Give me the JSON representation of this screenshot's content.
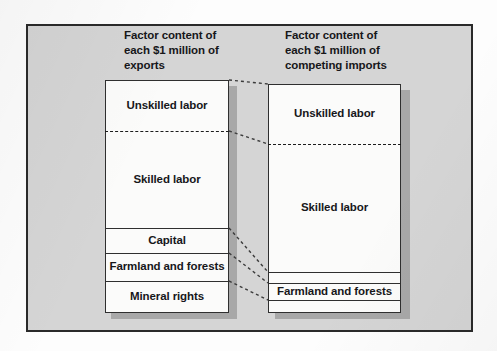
{
  "figure": {
    "columns": [
      {
        "id": "exports",
        "title": "Factor content of\neach $1 million of\nexports",
        "segments": [
          {
            "label": "Unskilled labor",
            "top": 80,
            "bottom": 131,
            "divider": "dashed"
          },
          {
            "label": "Skilled labor",
            "top": 131,
            "bottom": 228,
            "divider": "solid"
          },
          {
            "label": "Capital",
            "top": 228,
            "bottom": 253,
            "divider": "solid"
          },
          {
            "label": "Farmland and forests",
            "top": 253,
            "bottom": 281,
            "divider": "solid"
          },
          {
            "label": "Mineral rights",
            "top": 281,
            "bottom": 313,
            "divider": "none"
          }
        ]
      },
      {
        "id": "competing-imports",
        "title": "Factor content of\neach $1 million of\ncompeting imports",
        "segments": [
          {
            "label": "Unskilled labor",
            "top": 84,
            "bottom": 144,
            "divider": "dashed"
          },
          {
            "label": "Skilled labor",
            "top": 144,
            "bottom": 272,
            "divider": "solid"
          },
          {
            "label": "",
            "top": 272,
            "bottom": 283,
            "divider": "solid"
          },
          {
            "label": "Farmland and forests",
            "top": 283,
            "bottom": 300,
            "divider": "solid"
          },
          {
            "label": "",
            "top": 300,
            "bottom": 313,
            "divider": "none"
          }
        ]
      }
    ],
    "connectors": [
      {
        "x1": 229,
        "y1": 80,
        "x2": 268,
        "y2": 84
      },
      {
        "x1": 229,
        "y1": 131,
        "x2": 268,
        "y2": 144
      },
      {
        "x1": 229,
        "y1": 228,
        "x2": 268,
        "y2": 272
      },
      {
        "x1": 229,
        "y1": 253,
        "x2": 268,
        "y2": 283
      },
      {
        "x1": 229,
        "y1": 281,
        "x2": 268,
        "y2": 300
      }
    ],
    "colors": {
      "background": "#d5d5d5",
      "bar_fill": "#fbfbfa",
      "line": "#2f2f2f",
      "shadow": "#a8a8a8",
      "text": "#17171a"
    }
  }
}
